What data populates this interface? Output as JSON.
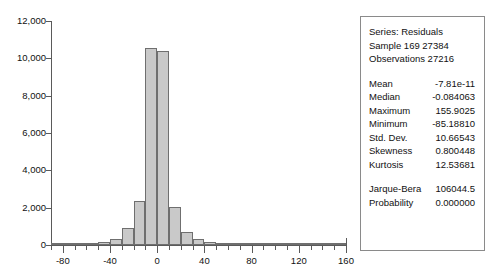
{
  "chart_data": {
    "type": "bar",
    "title": "",
    "xlabel": "",
    "ylabel": "",
    "grid": false,
    "legend": "none",
    "xlim": [
      -90,
      160
    ],
    "ylim": [
      0,
      12000
    ],
    "y_ticks": [
      "0",
      "2,000",
      "4,000",
      "6,000",
      "8,000",
      "10,000",
      "12,000"
    ],
    "y_tick_values": [
      0,
      2000,
      4000,
      6000,
      8000,
      10000,
      12000
    ],
    "x_ticks": [
      "-80",
      "-40",
      "0",
      "40",
      "80",
      "120",
      "160"
    ],
    "x_tick_values": [
      -80,
      -40,
      0,
      40,
      80,
      120,
      160
    ],
    "x_minor_step": 10,
    "bin_width": 10,
    "bar_color": "#c9c9c9",
    "bar_edge_color": "#6f6f6f",
    "bins": [
      {
        "x0": -90,
        "x1": -80,
        "count": 30
      },
      {
        "x0": -80,
        "x1": -70,
        "count": 40
      },
      {
        "x0": -70,
        "x1": -60,
        "count": 55
      },
      {
        "x0": -60,
        "x1": -50,
        "count": 80
      },
      {
        "x0": -50,
        "x1": -40,
        "count": 150
      },
      {
        "x0": -40,
        "x1": -30,
        "count": 330
      },
      {
        "x0": -30,
        "x1": -20,
        "count": 900
      },
      {
        "x0": -20,
        "x1": -10,
        "count": 2350
      },
      {
        "x0": -10,
        "x1": 0,
        "count": 10550
      },
      {
        "x0": 0,
        "x1": 10,
        "count": 10400
      },
      {
        "x0": 10,
        "x1": 20,
        "count": 2050
      },
      {
        "x0": 20,
        "x1": 30,
        "count": 700
      },
      {
        "x0": 30,
        "x1": 40,
        "count": 300
      },
      {
        "x0": 40,
        "x1": 50,
        "count": 160
      },
      {
        "x0": 50,
        "x1": 60,
        "count": 80
      },
      {
        "x0": 60,
        "x1": 70,
        "count": 50
      },
      {
        "x0": 70,
        "x1": 80,
        "count": 35
      },
      {
        "x0": 80,
        "x1": 90,
        "count": 25
      },
      {
        "x0": 90,
        "x1": 100,
        "count": 18
      },
      {
        "x0": 100,
        "x1": 110,
        "count": 12
      },
      {
        "x0": 110,
        "x1": 120,
        "count": 9
      },
      {
        "x0": 120,
        "x1": 130,
        "count": 7
      },
      {
        "x0": 130,
        "x1": 140,
        "count": 5
      },
      {
        "x0": 140,
        "x1": 150,
        "count": 4
      },
      {
        "x0": 150,
        "x1": 160,
        "count": 3
      }
    ]
  },
  "stats": {
    "series_line": "Series: Residuals",
    "sample_line": "Sample 169 27384",
    "observations_line": "Observations 27216",
    "rows": [
      {
        "label": "Mean",
        "value": "-7.81e-11"
      },
      {
        "label": "Median",
        "value": "-0.084063"
      },
      {
        "label": "Maximum",
        "value": "155.9025"
      },
      {
        "label": "Minimum",
        "value": "-85.18810"
      },
      {
        "label": "Std. Dev.",
        "value": "10.66543"
      },
      {
        "label": "Skewness",
        "value": "0.800448"
      },
      {
        "label": "Kurtosis",
        "value": "12.53681"
      }
    ],
    "test_rows": [
      {
        "label": "Jarque-Bera",
        "value": "106044.5"
      },
      {
        "label": "Probability",
        "value": "0.000000"
      }
    ]
  }
}
